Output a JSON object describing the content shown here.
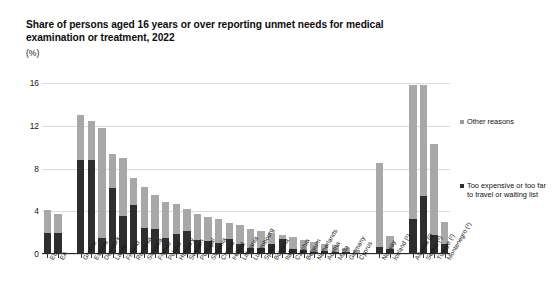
{
  "chart_data": {
    "type": "bar",
    "subtype": "stacked-column",
    "title": "Share of persons aged 16 years or over reporting unmet needs for medical examination or treatment, 2022",
    "unit_label": "(%)",
    "xlabel": "",
    "ylabel": "",
    "ylim": [
      0,
      16
    ],
    "yticks": [
      0,
      4,
      8,
      12,
      16
    ],
    "ytick_labels": [
      "0",
      "4",
      "8",
      "12",
      "16"
    ],
    "grid": true,
    "legend_position": "right",
    "colors": {
      "other_reasons": "#a8a8a8",
      "too_expensive": "#2e2e2e",
      "gridline": "#dcdcdc",
      "axis": "#2b2b2b",
      "text": "#111111"
    },
    "categories": [
      "EU",
      "EA",
      "Greece",
      "Estonia",
      "Denmark",
      "Latvia",
      "Finland",
      "Romania",
      "Slovakia",
      "France",
      "Poland",
      "Hungary",
      "Sweden",
      "Portugal",
      "Slovenia",
      "Croatia",
      "Ireland",
      "Lithuania",
      "Luxembourg",
      "Spain",
      "Bulgaria",
      "Italy",
      "Czechia",
      "Belgium",
      "Netherlands",
      "Austria",
      "Malta",
      "Germany",
      "Cyprus",
      "Norway",
      "Iceland (¹)",
      "Albania (²)",
      "Serbia (²)",
      "Türkiye (²)",
      "Montenegro (²)"
    ],
    "series": [
      {
        "name": "Too expensive or too far to travel or waiting list",
        "color": "#2e2e2e",
        "values": [
          2.0,
          2.0,
          8.8,
          8.8,
          1.5,
          6.2,
          3.6,
          4.6,
          2.4,
          2.3,
          1.5,
          1.9,
          2.2,
          1.3,
          1.2,
          1.0,
          1.4,
          0.9,
          0.6,
          0.6,
          0.9,
          1.4,
          0.5,
          0.4,
          0.2,
          0.3,
          0.2,
          0.2,
          0.1,
          0.7,
          0.5,
          3.3,
          5.4,
          1.8,
          0.9
        ]
      },
      {
        "name": "Other reasons",
        "color": "#a8a8a8",
        "values": [
          2.1,
          1.7,
          4.2,
          3.6,
          10.3,
          3.2,
          5.4,
          2.5,
          3.9,
          3.2,
          3.4,
          2.8,
          2.0,
          2.4,
          2.3,
          2.3,
          1.5,
          1.8,
          1.7,
          1.6,
          1.1,
          0.4,
          1.1,
          0.9,
          0.9,
          0.6,
          0.6,
          0.4,
          0.3,
          7.8,
          1.2,
          12.5,
          10.4,
          8.5,
          2.1
        ]
      }
    ],
    "totals": [
      4.1,
      3.7,
      13.0,
      12.4,
      11.8,
      9.4,
      9.0,
      7.1,
      6.3,
      5.5,
      4.9,
      4.7,
      4.2,
      3.7,
      3.5,
      3.3,
      2.9,
      2.7,
      2.3,
      2.2,
      2.0,
      1.8,
      1.6,
      1.3,
      1.1,
      0.9,
      0.8,
      0.6,
      0.4,
      8.5,
      1.7,
      15.8,
      15.8,
      10.3,
      3.0
    ],
    "group_breaks": [
      2,
      29,
      31
    ]
  },
  "legend": {
    "entries": [
      {
        "label": "Other reasons",
        "color": "#a8a8a8"
      },
      {
        "label": "Too expensive or too far to travel or waiting list",
        "color": "#2e2e2e"
      }
    ]
  }
}
